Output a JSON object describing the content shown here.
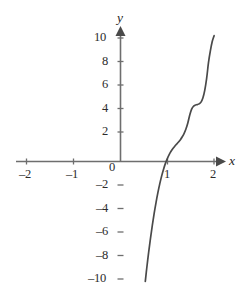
{
  "chart_data": {
    "type": "line",
    "title": "",
    "xlabel": "x",
    "ylabel": "y",
    "xlim": [
      -2.35,
      2.3
    ],
    "ylim": [
      -11.0,
      11.0
    ],
    "grid": false,
    "legend": null,
    "axis_style": "cartesian-cross-with-arrows",
    "xticks": [
      -2,
      -1,
      0,
      1,
      2
    ],
    "xtick_labels": [
      "–2",
      "–1",
      "0",
      "1",
      "2"
    ],
    "yticks": [
      -10,
      -8,
      -6,
      -4,
      -2,
      2,
      4,
      6,
      8,
      10
    ],
    "ytick_labels": [
      "–10",
      "–8",
      "–6",
      "–4",
      "–2",
      "2",
      "4",
      "6",
      "8",
      "10"
    ],
    "series": [
      {
        "name": "curve",
        "color": "#4a4a4a",
        "x": [
          0.53,
          0.56,
          0.6,
          0.64,
          0.68,
          0.72,
          0.76,
          0.8,
          0.84,
          0.88,
          0.92,
          0.96,
          1.0,
          1.04,
          1.08,
          1.12,
          1.16,
          1.2,
          1.24,
          1.28,
          1.32,
          1.36,
          1.4,
          1.44,
          1.48,
          1.52,
          1.56,
          1.6,
          1.64,
          1.68,
          1.72,
          1.76,
          1.8,
          1.84,
          1.88,
          1.92,
          1.96,
          2.0
        ],
        "y": [
          -10.2,
          -9.1,
          -7.77,
          -6.55,
          -5.43,
          -4.4,
          -3.47,
          -2.63,
          -1.88,
          -1.22,
          -0.65,
          -0.16,
          0.25,
          0.59,
          0.87,
          1.1,
          1.3,
          1.48,
          1.66,
          1.86,
          2.1,
          2.4,
          2.79,
          3.3,
          3.95,
          4.45,
          4.7,
          4.8,
          4.84,
          4.9,
          5.05,
          5.4,
          6.05,
          7.05,
          8.4,
          9.4,
          10.2,
          10.7
        ],
        "annotation": "monotonic increasing curve with a flat plateau near y ≈ 4.8 between x ≈ 1.55 and x ≈ 1.75; crosses the x-axis near x ≈ 0.78"
      }
    ],
    "zero_crossing_x": 0.78,
    "plateau_y": 4.8
  },
  "axes": {
    "x_axis_label": "x",
    "y_axis_label": "y",
    "x_arrow": true,
    "y_arrow": true
  },
  "colors": {
    "axis": "#6e6e6e",
    "curve": "#4a4a4a",
    "text": "#2b2b2b",
    "background": "#ffffff"
  }
}
